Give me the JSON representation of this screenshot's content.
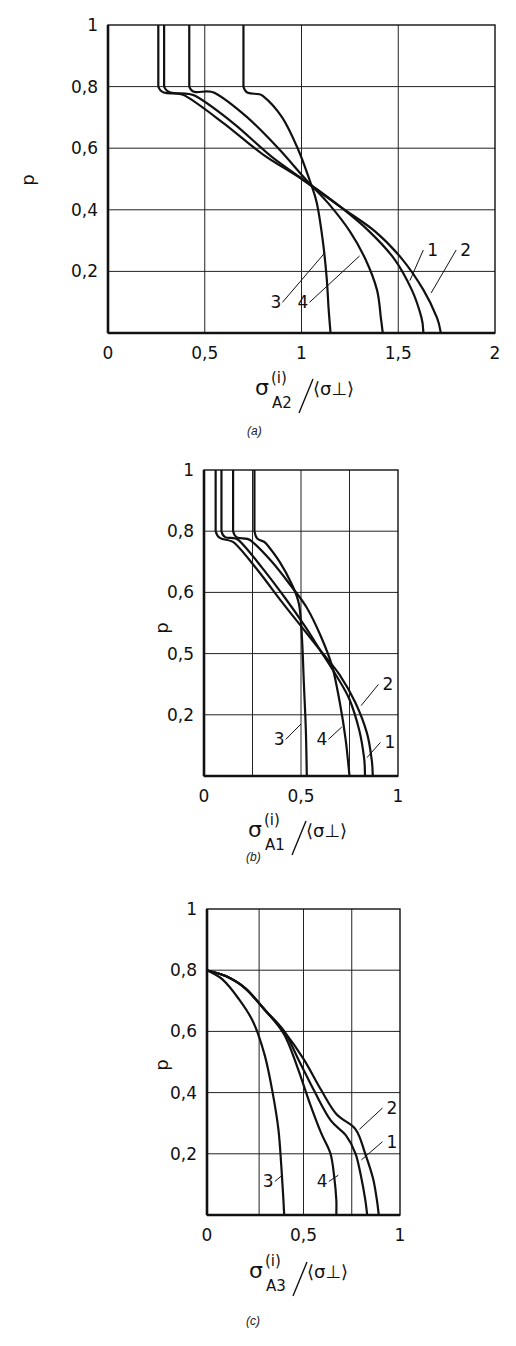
{
  "chart_data": [
    {
      "id": "a",
      "type": "line",
      "caption": "(a)",
      "ylabel": "p",
      "xlabel": {
        "main": "σ",
        "sup": "(i)",
        "sub": "A2",
        "denom": "⟨σ⊥⟩"
      },
      "xlim": [
        0,
        2
      ],
      "ylim": [
        0,
        1
      ],
      "xticks": [
        0,
        0.5,
        1,
        1.5,
        2
      ],
      "xtick_labels": [
        "0",
        "0,5",
        "1",
        "1,5",
        "2"
      ],
      "yticks": [
        0.2,
        0.4,
        0.6,
        0.8,
        1
      ],
      "ytick_labels": [
        "0,2",
        "0,4",
        "0,6",
        "0,8",
        "1"
      ],
      "grid": true,
      "series": [
        {
          "name": "1",
          "points": [
            [
              0.29,
              1
            ],
            [
              0.29,
              0.8
            ],
            [
              0.45,
              0.77
            ],
            [
              0.65,
              0.68
            ],
            [
              0.85,
              0.57
            ],
            [
              1.05,
              0.48
            ],
            [
              1.2,
              0.41
            ],
            [
              1.35,
              0.33
            ],
            [
              1.48,
              0.24
            ],
            [
              1.57,
              0.14
            ],
            [
              1.62,
              0.05
            ],
            [
              1.63,
              0.0
            ]
          ]
        },
        {
          "name": "2",
          "points": [
            [
              0.26,
              1
            ],
            [
              0.26,
              0.8
            ],
            [
              0.4,
              0.77
            ],
            [
              0.6,
              0.68
            ],
            [
              0.8,
              0.58
            ],
            [
              1.0,
              0.5
            ],
            [
              1.2,
              0.41
            ],
            [
              1.38,
              0.33
            ],
            [
              1.52,
              0.24
            ],
            [
              1.63,
              0.14
            ],
            [
              1.7,
              0.05
            ],
            [
              1.72,
              0.0
            ]
          ]
        },
        {
          "name": "3",
          "points": [
            [
              0.7,
              1
            ],
            [
              0.7,
              0.8
            ],
            [
              0.8,
              0.77
            ],
            [
              0.9,
              0.7
            ],
            [
              0.98,
              0.6
            ],
            [
              1.04,
              0.5
            ],
            [
              1.08,
              0.42
            ],
            [
              1.11,
              0.3
            ],
            [
              1.13,
              0.18
            ],
            [
              1.14,
              0.08
            ],
            [
              1.15,
              0.0
            ]
          ]
        },
        {
          "name": "4",
          "points": [
            [
              0.42,
              1
            ],
            [
              0.42,
              0.8
            ],
            [
              0.55,
              0.78
            ],
            [
              0.72,
              0.7
            ],
            [
              0.88,
              0.6
            ],
            [
              1.02,
              0.5
            ],
            [
              1.14,
              0.42
            ],
            [
              1.25,
              0.33
            ],
            [
              1.33,
              0.24
            ],
            [
              1.39,
              0.14
            ],
            [
              1.41,
              0.05
            ],
            [
              1.42,
              0.0
            ]
          ]
        }
      ],
      "annotations": [
        {
          "text": "1",
          "label_at": [
            1.65,
            0.25
          ],
          "pointer_to": [
            1.56,
            0.17
          ]
        },
        {
          "text": "2",
          "label_at": [
            1.82,
            0.25
          ],
          "pointer_to": [
            1.67,
            0.13
          ]
        },
        {
          "text": "3",
          "label_at": [
            0.86,
            0.08
          ],
          "pointer_to": [
            1.12,
            0.26
          ]
        },
        {
          "text": "4",
          "label_at": [
            1.0,
            0.08
          ],
          "pointer_to": [
            1.3,
            0.25
          ]
        }
      ]
    },
    {
      "id": "b",
      "type": "line",
      "caption": "(b)",
      "ylabel": "p",
      "xlabel": {
        "main": "σ",
        "sup": "(i)",
        "sub": "A1",
        "denom": "⟨σ⊥⟩"
      },
      "xlim": [
        0,
        1
      ],
      "ylim": [
        0,
        1
      ],
      "xticks": [
        0,
        0.5,
        1
      ],
      "xtick_labels": [
        "0",
        "0,5",
        "1"
      ],
      "yticks": [
        0.2,
        0.4,
        0.6,
        0.8,
        1
      ],
      "ytick_labels": [
        "0,2",
        "0,5",
        "0,6",
        "0,8",
        "1"
      ],
      "grid": true,
      "grid_x": [
        0.25,
        0.5,
        0.75
      ],
      "series": [
        {
          "name": "1",
          "points": [
            [
              0.09,
              1
            ],
            [
              0.09,
              0.8
            ],
            [
              0.18,
              0.77
            ],
            [
              0.3,
              0.68
            ],
            [
              0.42,
              0.58
            ],
            [
              0.52,
              0.49
            ],
            [
              0.6,
              0.41
            ],
            [
              0.68,
              0.33
            ],
            [
              0.75,
              0.25
            ],
            [
              0.8,
              0.15
            ],
            [
              0.825,
              0.06
            ],
            [
              0.83,
              0.0
            ]
          ]
        },
        {
          "name": "2",
          "points": [
            [
              0.06,
              1
            ],
            [
              0.06,
              0.8
            ],
            [
              0.16,
              0.76
            ],
            [
              0.28,
              0.67
            ],
            [
              0.4,
              0.57
            ],
            [
              0.5,
              0.49
            ],
            [
              0.6,
              0.41
            ],
            [
              0.7,
              0.33
            ],
            [
              0.78,
              0.24
            ],
            [
              0.84,
              0.14
            ],
            [
              0.865,
              0.05
            ],
            [
              0.87,
              0.0
            ]
          ]
        },
        {
          "name": "3",
          "points": [
            [
              0.26,
              1
            ],
            [
              0.26,
              0.8
            ],
            [
              0.32,
              0.76
            ],
            [
              0.39,
              0.7
            ],
            [
              0.45,
              0.63
            ],
            [
              0.49,
              0.56
            ],
            [
              0.505,
              0.45
            ],
            [
              0.515,
              0.3
            ],
            [
              0.525,
              0.15
            ],
            [
              0.53,
              0.0
            ]
          ]
        },
        {
          "name": "4",
          "points": [
            [
              0.15,
              1
            ],
            [
              0.15,
              0.8
            ],
            [
              0.24,
              0.77
            ],
            [
              0.35,
              0.7
            ],
            [
              0.45,
              0.62
            ],
            [
              0.53,
              0.55
            ],
            [
              0.6,
              0.46
            ],
            [
              0.66,
              0.36
            ],
            [
              0.7,
              0.24
            ],
            [
              0.73,
              0.12
            ],
            [
              0.75,
              0.0
            ]
          ]
        }
      ],
      "annotations": [
        {
          "text": "1",
          "label_at": [
            0.93,
            0.09
          ],
          "pointer_to": [
            0.84,
            0.06
          ]
        },
        {
          "text": "2",
          "label_at": [
            0.92,
            0.28
          ],
          "pointer_to": [
            0.81,
            0.23
          ]
        },
        {
          "text": "3",
          "label_at": [
            0.38,
            0.1
          ],
          "pointer_to": [
            0.5,
            0.17
          ]
        },
        {
          "text": "4",
          "label_at": [
            0.6,
            0.1
          ],
          "pointer_to": [
            0.71,
            0.16
          ]
        }
      ]
    },
    {
      "id": "c",
      "type": "line",
      "caption": "(c)",
      "ylabel": "p",
      "xlabel": {
        "main": "σ",
        "sup": "(i)",
        "sub": "A3",
        "denom": "⟨σ⊥⟩"
      },
      "xlim": [
        0,
        1
      ],
      "ylim": [
        0,
        1
      ],
      "xticks": [
        0,
        0.5,
        1
      ],
      "xtick_labels": [
        "0",
        "0,5",
        "1"
      ],
      "yticks": [
        0.2,
        0.4,
        0.6,
        0.8,
        1
      ],
      "ytick_labels": [
        "0,2",
        "0,4",
        "0,6",
        "0,8",
        "1"
      ],
      "grid": true,
      "grid_x": [
        0.27,
        0.5,
        0.75
      ],
      "series": [
        {
          "name": "1",
          "points": [
            [
              0.0,
              0.8
            ],
            [
              0.1,
              0.78
            ],
            [
              0.2,
              0.74
            ],
            [
              0.3,
              0.67
            ],
            [
              0.4,
              0.6
            ],
            [
              0.48,
              0.5
            ],
            [
              0.56,
              0.4
            ],
            [
              0.64,
              0.31
            ],
            [
              0.72,
              0.26
            ],
            [
              0.77,
              0.2
            ],
            [
              0.8,
              0.12
            ],
            [
              0.82,
              0.05
            ],
            [
              0.83,
              0.0
            ]
          ]
        },
        {
          "name": "2",
          "points": [
            [
              0.0,
              0.8
            ],
            [
              0.1,
              0.78
            ],
            [
              0.2,
              0.74
            ],
            [
              0.3,
              0.67
            ],
            [
              0.4,
              0.6
            ],
            [
              0.5,
              0.51
            ],
            [
              0.59,
              0.41
            ],
            [
              0.67,
              0.33
            ],
            [
              0.77,
              0.28
            ],
            [
              0.82,
              0.2
            ],
            [
              0.86,
              0.12
            ],
            [
              0.88,
              0.05
            ],
            [
              0.89,
              0.0
            ]
          ]
        },
        {
          "name": "3",
          "points": [
            [
              0.0,
              0.8
            ],
            [
              0.08,
              0.77
            ],
            [
              0.16,
              0.71
            ],
            [
              0.24,
              0.63
            ],
            [
              0.3,
              0.52
            ],
            [
              0.34,
              0.4
            ],
            [
              0.37,
              0.28
            ],
            [
              0.385,
              0.16
            ],
            [
              0.395,
              0.06
            ],
            [
              0.4,
              0.0
            ]
          ]
        },
        {
          "name": "4",
          "points": [
            [
              0.0,
              0.8
            ],
            [
              0.1,
              0.78
            ],
            [
              0.2,
              0.74
            ],
            [
              0.3,
              0.67
            ],
            [
              0.4,
              0.59
            ],
            [
              0.47,
              0.48
            ],
            [
              0.53,
              0.37
            ],
            [
              0.59,
              0.27
            ],
            [
              0.64,
              0.2
            ],
            [
              0.66,
              0.12
            ],
            [
              0.67,
              0.05
            ],
            [
              0.67,
              0.0
            ]
          ]
        }
      ],
      "annotations": [
        {
          "text": "1",
          "label_at": [
            0.93,
            0.22
          ],
          "pointer_to": [
            0.8,
            0.18
          ]
        },
        {
          "text": "2",
          "label_at": [
            0.93,
            0.33
          ],
          "pointer_to": [
            0.79,
            0.28
          ]
        },
        {
          "text": "3",
          "label_at": [
            0.31,
            0.09
          ],
          "pointer_to": [
            0.39,
            0.13
          ]
        },
        {
          "text": "4",
          "label_at": [
            0.59,
            0.09
          ],
          "pointer_to": [
            0.68,
            0.13
          ]
        }
      ]
    }
  ],
  "layout": {
    "panels": [
      {
        "id": "a",
        "top": 0,
        "plot": {
          "x0": 108,
          "x1": 495,
          "y0": 333,
          "y1": 25
        },
        "ylabel_at": [
          34,
          180
        ],
        "caption_at": [
          253,
          432
        ],
        "xlabel_at": [
          255,
          395
        ]
      },
      {
        "id": "b",
        "top": 0,
        "plot": {
          "x0": 204,
          "x1": 398,
          "y0": 776,
          "y1": 470
        },
        "ylabel_at": [
          168,
          628
        ],
        "caption_at": [
          252,
          858
        ],
        "xlabel_at": [
          248,
          837
        ]
      },
      {
        "id": "c",
        "top": 0,
        "plot": {
          "x0": 207,
          "x1": 400,
          "y0": 1215,
          "y1": 909
        },
        "ylabel_at": [
          168,
          1065
        ],
        "caption_at": [
          252,
          1322
        ],
        "xlabel_at": [
          249,
          1278
        ]
      }
    ]
  }
}
